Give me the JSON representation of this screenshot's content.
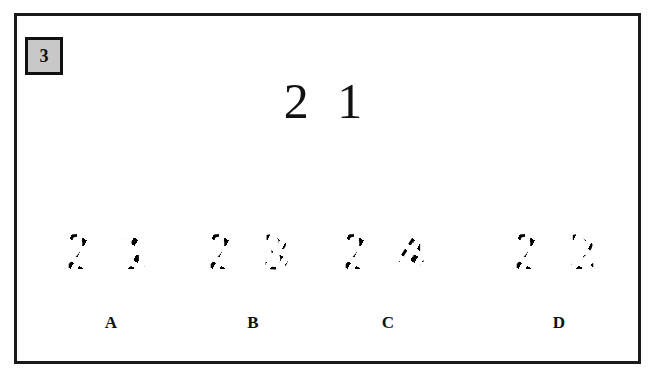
{
  "question": {
    "number": "3",
    "target_number": "2 1"
  },
  "options": [
    {
      "label": "A",
      "fragmented_number": "2 1"
    },
    {
      "label": "B",
      "fragmented_number": "2 3"
    },
    {
      "label": "C",
      "fragmented_number": "2 4"
    },
    {
      "label": "D",
      "fragmented_number": "2 2"
    }
  ],
  "colors": {
    "badge_fill": "#c8c8c8",
    "border": "#1a1a1a",
    "text": "#111111"
  }
}
